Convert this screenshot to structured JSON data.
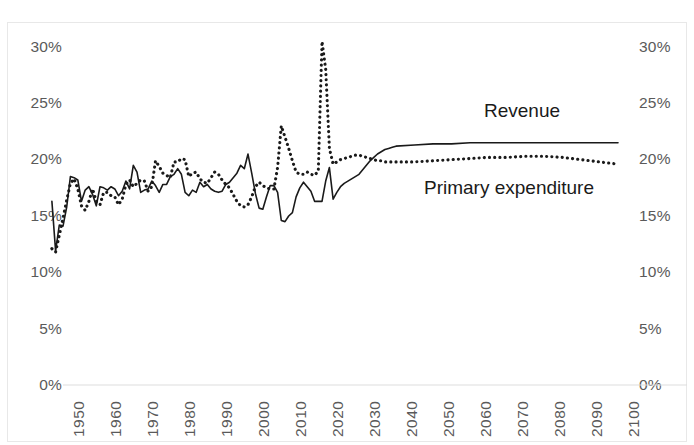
{
  "chart_data": {
    "type": "line",
    "title": "",
    "subtitle": "",
    "xlabel": "",
    "ylabel": "",
    "xlim": [
      1947,
      2100
    ],
    "ylim": [
      0,
      0.3
    ],
    "grid": false,
    "legend_position": "inline-annotation",
    "dual_y_axis": true,
    "y_tick_labels": [
      "30%",
      "25%",
      "20%",
      "15%",
      "10%",
      "5%",
      "0%"
    ],
    "y_tick_values": [
      30,
      25,
      20,
      15,
      10,
      5,
      0
    ],
    "y_tick_labels_right": [
      "30%",
      "25%",
      "20%",
      "15%",
      "10%",
      "5%",
      "0%"
    ],
    "x_tick_labels": [
      "1950",
      "1960",
      "1970",
      "1980",
      "1990",
      "2000",
      "2010",
      "2020",
      "2030",
      "2040",
      "2050",
      "2060",
      "2070",
      "2080",
      "2090",
      "2100"
    ],
    "x_tick_values": [
      1950,
      1960,
      1970,
      1980,
      1990,
      2000,
      2010,
      2020,
      2030,
      2040,
      2050,
      2060,
      2070,
      2080,
      2090,
      2100
    ],
    "annotations": [
      {
        "text": "Revenue",
        "series": "Revenue"
      },
      {
        "text": "Primary expenditure",
        "series": "Primary expenditure"
      }
    ],
    "series": [
      {
        "name": "Revenue",
        "style": "solid",
        "color": "#1a1a1a",
        "x": [
          1947,
          1948,
          1949,
          1950,
          1951,
          1952,
          1953,
          1954,
          1955,
          1956,
          1957,
          1958,
          1959,
          1960,
          1961,
          1962,
          1963,
          1964,
          1965,
          1966,
          1967,
          1968,
          1969,
          1970,
          1971,
          1972,
          1973,
          1974,
          1975,
          1976,
          1977,
          1978,
          1979,
          1980,
          1981,
          1982,
          1983,
          1984,
          1985,
          1986,
          1987,
          1988,
          1989,
          1990,
          1991,
          1992,
          1993,
          1994,
          1995,
          1996,
          1997,
          1998,
          1999,
          2000,
          2001,
          2002,
          2003,
          2004,
          2005,
          2006,
          2007,
          2008,
          2009,
          2010,
          2011,
          2012,
          2013,
          2014,
          2015,
          2016,
          2017,
          2018,
          2019,
          2020,
          2021,
          2022,
          2023,
          2024,
          2025,
          2026,
          2027,
          2028,
          2029,
          2030,
          2031,
          2032,
          2033,
          2034,
          2035,
          2036,
          2037,
          2038,
          2039,
          2040,
          2045,
          2050,
          2055,
          2060,
          2065,
          2070,
          2075,
          2080,
          2085,
          2090,
          2095,
          2100
        ],
        "values": [
          16.3,
          11.9,
          14.2,
          14.1,
          15.8,
          18.5,
          18.4,
          18.2,
          16.3,
          17.3,
          17.6,
          16.9,
          15.9,
          17.6,
          17.5,
          17.3,
          17.6,
          17.4,
          16.8,
          17.2,
          18.1,
          17.4,
          19.5,
          18.9,
          17.1,
          17.3,
          17.4,
          18.1,
          17.7,
          17.1,
          17.8,
          17.8,
          18.5,
          18.7,
          19.2,
          18.7,
          17.1,
          16.8,
          17.3,
          17.1,
          18.0,
          17.6,
          17.8,
          17.4,
          17.2,
          17.1,
          17.2,
          17.8,
          18.0,
          18.4,
          18.8,
          19.5,
          19.2,
          20.5,
          18.8,
          17.0,
          15.7,
          15.6,
          16.7,
          17.7,
          17.7,
          17.1,
          14.6,
          14.5,
          15.0,
          15.3,
          16.7,
          17.5,
          18.0,
          17.6,
          17.2,
          16.3,
          16.3,
          16.3,
          18.1,
          19.3,
          16.5,
          17.1,
          17.6,
          17.9,
          18.1,
          18.3,
          18.5,
          18.7,
          19.1,
          19.5,
          19.9,
          20.2,
          20.5,
          20.7,
          20.9,
          21.0,
          21.1,
          21.2,
          21.3,
          21.4,
          21.4,
          21.5,
          21.5,
          21.5,
          21.5,
          21.5,
          21.5,
          21.5,
          21.5,
          21.5
        ]
      },
      {
        "name": "Primary expenditure",
        "style": "dotted",
        "color": "#1a1a1a",
        "x": [
          1947,
          1948,
          1949,
          1950,
          1951,
          1952,
          1953,
          1954,
          1955,
          1956,
          1957,
          1958,
          1959,
          1960,
          1961,
          1962,
          1963,
          1964,
          1965,
          1966,
          1967,
          1968,
          1969,
          1970,
          1971,
          1972,
          1973,
          1974,
          1975,
          1976,
          1977,
          1978,
          1979,
          1980,
          1981,
          1982,
          1983,
          1984,
          1985,
          1986,
          1987,
          1988,
          1989,
          1990,
          1991,
          1992,
          1993,
          1994,
          1995,
          1996,
          1997,
          1998,
          1999,
          2000,
          2001,
          2002,
          2003,
          2004,
          2005,
          2006,
          2007,
          2008,
          2009,
          2010,
          2011,
          2012,
          2013,
          2014,
          2015,
          2016,
          2017,
          2018,
          2019,
          2020,
          2021,
          2022,
          2023,
          2024,
          2025,
          2026,
          2027,
          2028,
          2029,
          2030,
          2031,
          2032,
          2033,
          2034,
          2035,
          2036,
          2037,
          2038,
          2039,
          2040,
          2045,
          2050,
          2055,
          2060,
          2065,
          2070,
          2075,
          2080,
          2085,
          2090,
          2095,
          2100
        ],
        "values": [
          12.1,
          11.8,
          13.3,
          14.8,
          16.4,
          17.9,
          18.3,
          17.4,
          15.9,
          15.5,
          16.3,
          17.4,
          16.3,
          16.0,
          17.1,
          17.1,
          16.8,
          16.7,
          16.0,
          16.5,
          17.8,
          18.2,
          17.6,
          17.9,
          18.2,
          18.1,
          17.2,
          17.6,
          19.9,
          19.4,
          18.8,
          18.6,
          18.4,
          19.8,
          19.8,
          20.1,
          20.0,
          18.5,
          18.8,
          18.9,
          18.3,
          18.0,
          17.9,
          18.4,
          18.9,
          18.7,
          18.2,
          17.8,
          17.5,
          16.9,
          16.3,
          15.9,
          15.8,
          16.0,
          16.7,
          17.6,
          18.0,
          17.7,
          17.5,
          17.4,
          17.4,
          19.3,
          23.0,
          22.0,
          21.0,
          19.9,
          18.9,
          18.7,
          18.7,
          18.9,
          18.7,
          18.6,
          19.0,
          30.5,
          28.0,
          21.0,
          19.6,
          19.8,
          20.0,
          20.1,
          20.2,
          20.3,
          20.4,
          20.4,
          20.3,
          20.2,
          20.1,
          20.0,
          19.9,
          19.9,
          19.8,
          19.8,
          19.8,
          19.8,
          19.8,
          19.9,
          20.0,
          20.1,
          20.2,
          20.2,
          20.3,
          20.3,
          20.2,
          20.0,
          19.8,
          19.6
        ]
      }
    ]
  },
  "axes": {
    "left_ticks": [
      "30%",
      "25%",
      "20%",
      "15%",
      "10%",
      "5%",
      "0%"
    ],
    "right_ticks": [
      "30%",
      "25%",
      "20%",
      "15%",
      "10%",
      "5%",
      "0%"
    ],
    "x_ticks": [
      "1950",
      "1960",
      "1970",
      "1980",
      "1990",
      "2000",
      "2010",
      "2020",
      "2030",
      "2040",
      "2050",
      "2060",
      "2070",
      "2080",
      "2090",
      "2100"
    ]
  },
  "annotations": {
    "revenue_label": "Revenue",
    "expenditure_label": "Primary expenditure"
  },
  "colors": {
    "series_line": "#1a1a1a",
    "axis_text": "#5a5a5a",
    "frame": "#e8e8e8",
    "background": "#ffffff"
  }
}
